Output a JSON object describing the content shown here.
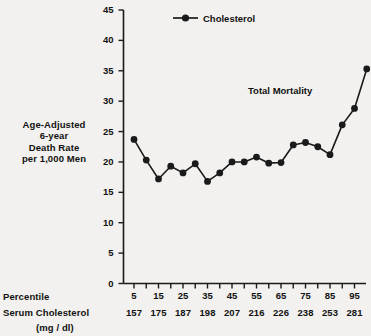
{
  "chart_data": {
    "type": "line",
    "title": "",
    "annotation": "Total Mortality",
    "legend": [
      {
        "name": "Cholesterol",
        "marker": "filled-circle",
        "line": "solid"
      }
    ],
    "legend_position": "top-center",
    "grid": false,
    "ylabel": "Age-Adjusted 6-year Death Rate per 1,000 Men",
    "ylabel_lines": [
      "Age-Adjusted",
      "6-year",
      "Death Rate",
      "per 1,000 Men"
    ],
    "ylim": [
      0,
      45
    ],
    "yticks": [
      0,
      5,
      10,
      15,
      20,
      25,
      30,
      35,
      40,
      45
    ],
    "ytick_labels": [
      "0",
      "5",
      "10",
      "15",
      "20",
      "25",
      "30",
      "35",
      "40",
      "45"
    ],
    "xlabel": "Percentile",
    "xlabel2": "Serum Cholesterol",
    "xlabel2_units": "(mg / dl)",
    "x": [
      5,
      10,
      15,
      20,
      25,
      30,
      35,
      40,
      45,
      50,
      55,
      60,
      65,
      70,
      75,
      80,
      85,
      90,
      95
    ],
    "xtick_labels_percentile": [
      "5",
      "",
      "15",
      "",
      "25",
      "",
      "35",
      "",
      "45",
      "",
      "55",
      "",
      "65",
      "",
      "75",
      "",
      "85",
      "",
      "95"
    ],
    "xticks_labeled_percentile": [
      "5",
      "15",
      "25",
      "35",
      "45",
      "55",
      "65",
      "75",
      "85",
      "95"
    ],
    "xticks_labeled_serum": [
      "157",
      "175",
      "187",
      "198",
      "207",
      "216",
      "226",
      "238",
      "253",
      "281"
    ],
    "values": [
      23.7,
      20.3,
      17.2,
      19.3,
      18.2,
      19.7,
      16.8,
      18.2,
      20.0,
      20.0,
      20.8,
      19.8,
      19.9,
      22.8,
      23.2,
      22.5,
      21.2,
      26.1,
      28.8
    ],
    "values_full": [
      {
        "percentile": 5,
        "serum": 157,
        "rate": 23.7
      },
      {
        "percentile": 10,
        "serum": null,
        "rate": 20.3
      },
      {
        "percentile": 15,
        "serum": 175,
        "rate": 17.2
      },
      {
        "percentile": 20,
        "serum": null,
        "rate": 19.3
      },
      {
        "percentile": 25,
        "serum": 187,
        "rate": 18.2
      },
      {
        "percentile": 30,
        "serum": null,
        "rate": 19.7
      },
      {
        "percentile": 35,
        "serum": 198,
        "rate": 16.8
      },
      {
        "percentile": 40,
        "serum": null,
        "rate": 18.2
      },
      {
        "percentile": 45,
        "serum": 207,
        "rate": 20.0
      },
      {
        "percentile": 50,
        "serum": null,
        "rate": 20.0
      },
      {
        "percentile": 55,
        "serum": 216,
        "rate": 20.8
      },
      {
        "percentile": 60,
        "serum": null,
        "rate": 19.8
      },
      {
        "percentile": 65,
        "serum": 226,
        "rate": 19.9
      },
      {
        "percentile": 70,
        "serum": null,
        "rate": 22.8
      },
      {
        "percentile": 75,
        "serum": 238,
        "rate": 23.2
      },
      {
        "percentile": 80,
        "serum": null,
        "rate": 22.5
      },
      {
        "percentile": 85,
        "serum": 253,
        "rate": 21.2
      },
      {
        "percentile": 90,
        "serum": null,
        "rate": 26.1
      },
      {
        "percentile": 95,
        "serum": 281,
        "rate": 28.8
      },
      {
        "percentile": 100,
        "serum": null,
        "rate": 35.3
      }
    ],
    "colors": {
      "series": "#1a1a1a",
      "axis": "#1a1a1a",
      "text": "#111111",
      "background": "#f2f1ef"
    }
  }
}
